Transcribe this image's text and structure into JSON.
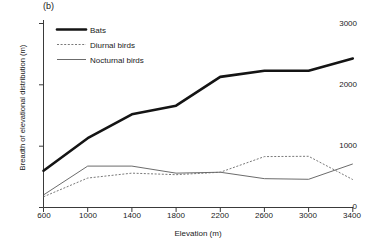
{
  "figure": {
    "panel_label": "(b)",
    "background_color": "#ffffff",
    "line_color": "#1a1a1a"
  },
  "chart_data": {
    "type": "line",
    "title": "",
    "panel": "(b)",
    "xlabel": "Elevation (m)",
    "ylabel": "Breadth of elevational distribution (m)",
    "x": [
      600,
      1000,
      1400,
      1800,
      2200,
      2600,
      3000,
      3400
    ],
    "xtick_labels": [
      "600",
      "1000",
      "1400",
      "1800",
      "2200",
      "2600",
      "3000",
      "3400"
    ],
    "ytick_values": [
      0,
      1000,
      2000,
      3000
    ],
    "ytick_labels": [
      "0",
      "1000",
      "2000",
      "3000"
    ],
    "xlim": [
      600,
      3400
    ],
    "ylim": [
      0,
      3100
    ],
    "grid": false,
    "legend_position": "upper-left",
    "series": [
      {
        "name": "Bats",
        "style": "solid-thick",
        "values": [
          600,
          1130,
          1520,
          1660,
          2130,
          2230,
          2230,
          2430
        ]
      },
      {
        "name": "Diurnal birds",
        "style": "dotted",
        "values": [
          175,
          480,
          560,
          535,
          575,
          830,
          835,
          455
        ]
      },
      {
        "name": "Nocturnal birds",
        "style": "solid-thin",
        "values": [
          205,
          675,
          675,
          560,
          575,
          470,
          460,
          710
        ]
      }
    ]
  },
  "legend": {
    "items": [
      {
        "label": "Bats"
      },
      {
        "label": "Diurnal birds"
      },
      {
        "label": "Nocturnal birds"
      }
    ]
  }
}
